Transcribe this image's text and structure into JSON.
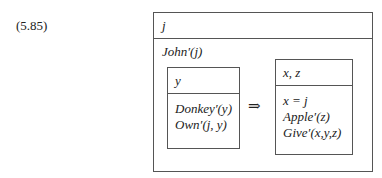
{
  "equation_number": "(5.85)",
  "outer_drs": {
    "universe": "j",
    "conditions": [
      "John′(j)"
    ]
  },
  "antecedent_drs": {
    "universe": "y",
    "conditions": [
      "Donkey′(y)",
      "Own′(j, y)"
    ]
  },
  "implication_symbol": "⇒",
  "consequent_drs": {
    "universe": "x, z",
    "conditions": [
      "x = j",
      "Apple′(z)",
      "Give′(x,y,z)"
    ]
  }
}
